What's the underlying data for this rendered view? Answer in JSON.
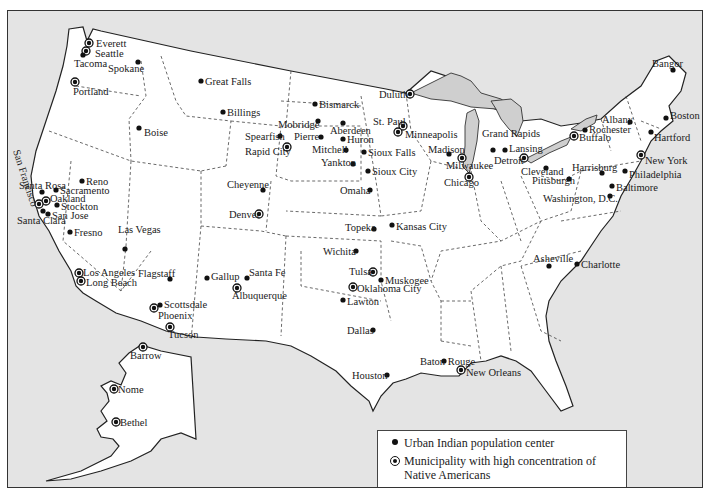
{
  "map": {
    "colors": {
      "water": "#e4e4e4",
      "land": "#ffffff",
      "lakes": "#cfcfcf",
      "ink": "#111111"
    },
    "rotated_label": "San Francisco",
    "cities": [
      {
        "name": "Everett",
        "x": 88,
        "y": 42,
        "type": "high",
        "lx": 95,
        "ly": 46
      },
      {
        "name": "Seattle",
        "x": 85,
        "y": 50,
        "type": "high",
        "lx": 94,
        "ly": 56
      },
      {
        "name": "Tacoma",
        "x": 82,
        "y": 54,
        "type": "urban",
        "lx": 73,
        "ly": 66
      },
      {
        "name": "Spokane",
        "x": 137,
        "y": 61,
        "type": "urban",
        "lx": 107,
        "ly": 71
      },
      {
        "name": "Portland",
        "x": 74,
        "y": 81,
        "type": "high",
        "lx": 72,
        "ly": 94
      },
      {
        "name": "Boise",
        "x": 138,
        "y": 127,
        "type": "urban",
        "lx": 143,
        "ly": 135
      },
      {
        "name": "Great Falls",
        "x": 200,
        "y": 80,
        "type": "urban",
        "lx": 204,
        "ly": 84
      },
      {
        "name": "Billings",
        "x": 222,
        "y": 111,
        "type": "urban",
        "lx": 226,
        "ly": 115
      },
      {
        "name": "Bismarck",
        "x": 314,
        "y": 103,
        "type": "urban",
        "lx": 318,
        "ly": 107
      },
      {
        "name": "Mobridge",
        "x": 317,
        "y": 120,
        "type": "urban",
        "lx": 277,
        "ly": 127
      },
      {
        "name": "Aberdeen",
        "x": 342,
        "y": 122,
        "type": "urban",
        "lx": 329,
        "ly": 133
      },
      {
        "name": "Spearfish",
        "x": 279,
        "y": 135,
        "type": "urban",
        "lx": 244,
        "ly": 139
      },
      {
        "name": "Pierre",
        "x": 320,
        "y": 136,
        "type": "urban",
        "lx": 293,
        "ly": 139
      },
      {
        "name": "Huron",
        "x": 342,
        "y": 138,
        "type": "urban",
        "lx": 346,
        "ly": 142
      },
      {
        "name": "Rapid City",
        "x": 286,
        "y": 146,
        "type": "high",
        "lx": 244,
        "ly": 154
      },
      {
        "name": "Mitchell",
        "x": 345,
        "y": 149,
        "type": "urban",
        "lx": 311,
        "ly": 152
      },
      {
        "name": "Sioux Falls",
        "x": 363,
        "y": 151,
        "type": "urban",
        "lx": 367,
        "ly": 155
      },
      {
        "name": "Yankton",
        "x": 352,
        "y": 163,
        "type": "urban",
        "lx": 320,
        "ly": 165
      },
      {
        "name": "Sioux City",
        "x": 367,
        "y": 170,
        "type": "urban",
        "lx": 371,
        "ly": 174
      },
      {
        "name": "Cheyenne",
        "x": 262,
        "y": 189,
        "type": "urban",
        "lx": 226,
        "ly": 187
      },
      {
        "name": "Omaha",
        "x": 369,
        "y": 189,
        "type": "urban",
        "lx": 339,
        "ly": 193
      },
      {
        "name": "Denver",
        "x": 258,
        "y": 213,
        "type": "high",
        "lx": 228,
        "ly": 217
      },
      {
        "name": "St. Paul",
        "x": 402,
        "y": 125,
        "type": "high",
        "lx": 372,
        "ly": 124
      },
      {
        "name": "Minneapolis",
        "x": 397,
        "y": 131,
        "type": "high",
        "lx": 404,
        "ly": 137
      },
      {
        "name": "Duluth",
        "x": 409,
        "y": 93,
        "type": "high",
        "lx": 378,
        "ly": 97
      },
      {
        "name": "Madison",
        "x": 448,
        "y": 153,
        "type": "urban",
        "lx": 427,
        "ly": 152
      },
      {
        "name": "Milwaukee",
        "x": 461,
        "y": 157,
        "type": "high",
        "lx": 445,
        "ly": 168
      },
      {
        "name": "Chicago",
        "x": 468,
        "y": 176,
        "type": "high",
        "lx": 443,
        "ly": 185
      },
      {
        "name": "Grand Rapids",
        "x": 492,
        "y": 149,
        "type": "urban",
        "lx": 481,
        "ly": 136
      },
      {
        "name": "Lansing",
        "x": 504,
        "y": 149,
        "type": "urban",
        "lx": 508,
        "ly": 151
      },
      {
        "name": "Detroit",
        "x": 523,
        "y": 157,
        "type": "high",
        "lx": 493,
        "ly": 163
      },
      {
        "name": "Cleveland",
        "x": 545,
        "y": 167,
        "type": "urban",
        "lx": 520,
        "ly": 174
      },
      {
        "name": "Pittsburgh",
        "x": 568,
        "y": 178,
        "type": "urban",
        "lx": 531,
        "ly": 183
      },
      {
        "name": "Buffalo",
        "x": 573,
        "y": 135,
        "type": "high",
        "lx": 578,
        "ly": 140
      },
      {
        "name": "Rochester",
        "x": 584,
        "y": 129,
        "type": "urban",
        "lx": 588,
        "ly": 132
      },
      {
        "name": "Albany",
        "x": 629,
        "y": 121,
        "type": "urban",
        "lx": 601,
        "ly": 122
      },
      {
        "name": "Bangor",
        "x": 672,
        "y": 69,
        "type": "urban",
        "lx": 651,
        "ly": 66
      },
      {
        "name": "Boston",
        "x": 665,
        "y": 117,
        "type": "urban",
        "lx": 669,
        "ly": 118
      },
      {
        "name": "Hartford",
        "x": 650,
        "y": 131,
        "type": "urban",
        "lx": 653,
        "ly": 140
      },
      {
        "name": "New York",
        "x": 640,
        "y": 154,
        "type": "high",
        "lx": 644,
        "ly": 163
      },
      {
        "name": "Harrisburg",
        "x": 601,
        "y": 172,
        "type": "urban",
        "lx": 571,
        "ly": 170
      },
      {
        "name": "Philadelphia",
        "x": 624,
        "y": 170,
        "type": "urban",
        "lx": 628,
        "ly": 177
      },
      {
        "name": "Baltimore",
        "x": 611,
        "y": 185,
        "type": "urban",
        "lx": 615,
        "ly": 190
      },
      {
        "name": "Washington, D.C.",
        "x": 609,
        "y": 195,
        "type": "urban",
        "lx": 542,
        "ly": 201
      },
      {
        "name": "Reno",
        "x": 81,
        "y": 180,
        "type": "urban",
        "lx": 85,
        "ly": 184
      },
      {
        "name": "Santa Rosa",
        "x": 41,
        "y": 191,
        "type": "urban",
        "lx": 18,
        "ly": 188
      },
      {
        "name": "Sacramento",
        "x": 55,
        "y": 189,
        "type": "urban",
        "lx": 59,
        "ly": 193
      },
      {
        "name": "Oakland",
        "x": 45,
        "y": 200,
        "type": "high",
        "lx": 49,
        "ly": 201
      },
      {
        "name": "San Francisco",
        "x": 38,
        "y": 203,
        "type": "high"
      },
      {
        "name": "Stockton",
        "x": 56,
        "y": 204,
        "type": "urban",
        "lx": 60,
        "ly": 209
      },
      {
        "name": "San Jose",
        "x": 47,
        "y": 213,
        "type": "urban",
        "lx": 51,
        "ly": 218
      },
      {
        "name": "Santa Clara",
        "x": 42,
        "y": 210,
        "type": "urban",
        "lx": 16,
        "ly": 223
      },
      {
        "name": "Fresno",
        "x": 69,
        "y": 231,
        "type": "urban",
        "lx": 73,
        "ly": 235
      },
      {
        "name": "Las Vegas",
        "x": 124,
        "y": 248,
        "type": "urban",
        "lx": 117,
        "ly": 232
      },
      {
        "name": "Los Angeles",
        "x": 78,
        "y": 272,
        "type": "high",
        "lx": 82,
        "ly": 275
      },
      {
        "name": "Long Beach",
        "x": 80,
        "y": 280,
        "type": "high",
        "lx": 85,
        "ly": 285
      },
      {
        "name": "Flagstaff",
        "x": 169,
        "y": 278,
        "type": "urban",
        "lx": 137,
        "ly": 276
      },
      {
        "name": "Gallup",
        "x": 206,
        "y": 277,
        "type": "urban",
        "lx": 210,
        "ly": 279
      },
      {
        "name": "Santa Fe",
        "x": 246,
        "y": 277,
        "type": "urban",
        "lx": 248,
        "ly": 275
      },
      {
        "name": "Albuquerque",
        "x": 236,
        "y": 287,
        "type": "high",
        "lx": 231,
        "ly": 298
      },
      {
        "name": "Scottsdale",
        "x": 159,
        "y": 304,
        "type": "urban",
        "lx": 163,
        "ly": 307
      },
      {
        "name": "Phoenix",
        "x": 153,
        "y": 307,
        "type": "high",
        "lx": 157,
        "ly": 318
      },
      {
        "name": "Tucson",
        "x": 169,
        "y": 326,
        "type": "high",
        "lx": 167,
        "ly": 337
      },
      {
        "name": "Topeka",
        "x": 373,
        "y": 228,
        "type": "urban",
        "lx": 344,
        "ly": 230
      },
      {
        "name": "Kansas City",
        "x": 391,
        "y": 224,
        "type": "urban",
        "lx": 395,
        "ly": 229
      },
      {
        "name": "Wichita",
        "x": 355,
        "y": 250,
        "type": "urban",
        "lx": 322,
        "ly": 254
      },
      {
        "name": "Tulsa",
        "x": 372,
        "y": 271,
        "type": "high",
        "lx": 348,
        "ly": 274
      },
      {
        "name": "Muskogee",
        "x": 380,
        "y": 279,
        "type": "urban",
        "lx": 384,
        "ly": 283
      },
      {
        "name": "Oklahoma City",
        "x": 352,
        "y": 286,
        "type": "high",
        "lx": 356,
        "ly": 291
      },
      {
        "name": "Lawton",
        "x": 342,
        "y": 299,
        "type": "urban",
        "lx": 346,
        "ly": 304
      },
      {
        "name": "Dallas",
        "x": 372,
        "y": 329,
        "type": "urban",
        "lx": 346,
        "ly": 333
      },
      {
        "name": "Houston",
        "x": 386,
        "y": 374,
        "type": "urban",
        "lx": 351,
        "ly": 378
      },
      {
        "name": "Baton Rouge",
        "x": 443,
        "y": 360,
        "type": "urban",
        "lx": 419,
        "ly": 364
      },
      {
        "name": "New Orleans",
        "x": 460,
        "y": 369,
        "type": "high",
        "lx": 465,
        "ly": 375
      },
      {
        "name": "Asheville",
        "x": 548,
        "y": 265,
        "type": "urban",
        "lx": 532,
        "ly": 261
      },
      {
        "name": "Charlotte",
        "x": 576,
        "y": 263,
        "type": "urban",
        "lx": 580,
        "ly": 267
      },
      {
        "name": "Barrow",
        "x": 142,
        "y": 346,
        "type": "high",
        "lx": 129,
        "ly": 358
      },
      {
        "name": "Nome",
        "x": 113,
        "y": 388,
        "type": "high",
        "lx": 117,
        "ly": 392
      },
      {
        "name": "Bethel",
        "x": 115,
        "y": 421,
        "type": "high",
        "lx": 119,
        "ly": 425
      }
    ]
  },
  "legend": {
    "items": [
      {
        "symbol": "filled-dot",
        "label": "Urban Indian population center"
      },
      {
        "symbol": "ringed-dot",
        "label": "Municipality with high concentration of Native Americans"
      }
    ]
  }
}
